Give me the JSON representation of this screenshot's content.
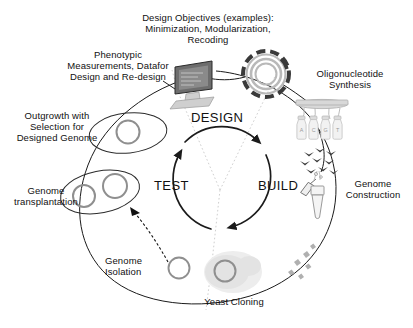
{
  "diagram": {
    "title_block": "Design Objectives (examples):\nMinimization, Modularization,\nRecoding",
    "background_color": "#ffffff",
    "text_color": "#111111"
  },
  "phases": [
    {
      "key": "design",
      "label": "DESIGN"
    },
    {
      "key": "build",
      "label": "BUILD"
    },
    {
      "key": "test",
      "label": "TEST"
    }
  ],
  "stages": [
    {
      "key": "phenotypic",
      "label": "Phenotypic\nMeasurements, Datafor\nDesign and Re-design",
      "icon": "computer-monitor-icon"
    },
    {
      "key": "outgrowth",
      "label": "Outgrowth with\nSelection for\nDesigned Genome",
      "icon": "cell-single-genome-icon"
    },
    {
      "key": "transplantation",
      "label": "Genome\ntransplantation",
      "icon": "cell-two-genomes-icon"
    },
    {
      "key": "isolation",
      "label": "Genome\nIsolation",
      "icon": "genome-circle-icon"
    },
    {
      "key": "yeast",
      "label": "Yeast Cloning",
      "icon": "yeast-cell-icon"
    },
    {
      "key": "construction",
      "label": "Genome\nConstruction",
      "icon": "pipette-tube-icon"
    },
    {
      "key": "oligo",
      "label": "Oligonucleotide\nSynthesis",
      "icon": "synthesizer-bottles-icon"
    }
  ],
  "oligo_bases": [
    "A",
    "C",
    "G",
    "T"
  ]
}
